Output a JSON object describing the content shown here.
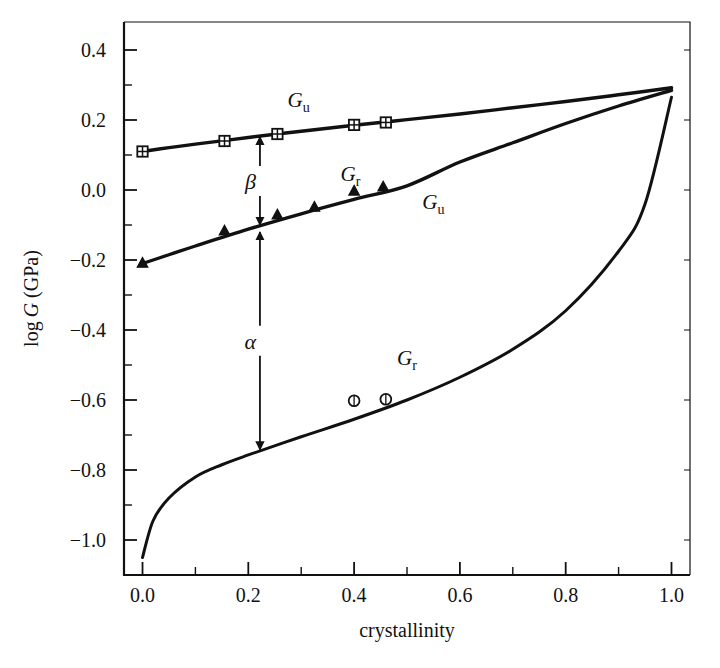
{
  "figure": {
    "background_color": "#ffffff",
    "ink_color": "#111111"
  },
  "chart_data": {
    "type": "line",
    "title": "",
    "subtitle": "",
    "xlabel": "crystallinity",
    "ylabel": "log G (GPa)",
    "xlim": [
      -0.035,
      1.035
    ],
    "ylim": [
      -1.1,
      0.48
    ],
    "grid": false,
    "legend_position": "inline-labels",
    "x_ticks_major": [
      "0.0",
      "0.2",
      "0.4",
      "0.6",
      "0.8",
      "1.0"
    ],
    "x_tick_values": [
      0.0,
      0.2,
      0.4,
      0.6,
      0.8,
      1.0
    ],
    "x_ticks_minor": [
      0.1,
      0.3,
      0.5,
      0.7,
      0.9
    ],
    "y_ticks_major": [
      "0.4",
      "0.2",
      "0.0",
      "-0.2",
      "-0.4",
      "-0.6",
      "-0.8",
      "-1.0"
    ],
    "y_tick_values": [
      0.4,
      0.2,
      0.0,
      -0.2,
      -0.4,
      -0.6,
      -0.8,
      -1.0
    ],
    "series": [
      {
        "name": "G_u upper",
        "label": "Gu",
        "label_base": "G",
        "label_sub": "u",
        "marker": "crossed-square",
        "marker_filled": true,
        "x": [
          0.0,
          0.05,
          0.1,
          0.2,
          0.3,
          0.4,
          0.5,
          0.6,
          0.7,
          0.8,
          0.9,
          1.0
        ],
        "values": [
          0.11,
          0.121,
          0.131,
          0.15,
          0.168,
          0.185,
          0.201,
          0.217,
          0.235,
          0.253,
          0.272,
          0.292
        ],
        "points_x": [
          0.0,
          0.155,
          0.255,
          0.4,
          0.46
        ],
        "points_y": [
          0.11,
          0.14,
          0.16,
          0.186,
          0.193
        ]
      },
      {
        "name": "G_r middle",
        "label": "Gr",
        "label_base": "G",
        "label_sub": "r",
        "second_label_base": "G",
        "second_label_sub": "u",
        "marker": "triangle",
        "marker_filled": true,
        "x": [
          0.0,
          0.05,
          0.1,
          0.2,
          0.3,
          0.4,
          0.5,
          0.6,
          0.7,
          0.8,
          0.9,
          1.0
        ],
        "values": [
          -0.21,
          -0.185,
          -0.16,
          -0.112,
          -0.068,
          -0.027,
          0.012,
          0.08,
          0.135,
          0.19,
          0.24,
          0.285
        ],
        "points_x": [
          0.0,
          0.155,
          0.255,
          0.325,
          0.4,
          0.455
        ],
        "points_y": [
          -0.21,
          -0.118,
          -0.072,
          -0.05,
          -0.004,
          0.008
        ]
      },
      {
        "name": "G_r lower",
        "label": "Gr",
        "label_base": "G",
        "label_sub": "r",
        "marker": "circle",
        "marker_filled": false,
        "x": [
          0.0,
          0.02,
          0.05,
          0.1,
          0.15,
          0.2,
          0.3,
          0.4,
          0.5,
          0.6,
          0.7,
          0.8,
          0.9,
          0.95,
          1.0
        ],
        "values": [
          -1.05,
          -0.945,
          -0.88,
          -0.82,
          -0.785,
          -0.757,
          -0.705,
          -0.655,
          -0.6,
          -0.535,
          -0.455,
          -0.345,
          -0.175,
          -0.04,
          0.265
        ],
        "points_x": [
          0.4,
          0.46
        ],
        "points_y": [
          -0.602,
          -0.598
        ]
      }
    ],
    "annotations": [
      {
        "name": "beta-gap",
        "text": "β",
        "x": 0.222,
        "y_top": 0.152,
        "y_bottom": -0.1,
        "style": "double-arrow-vertical"
      },
      {
        "name": "alpha-gap",
        "text": "α",
        "x": 0.222,
        "y_top": -0.12,
        "y_bottom": -0.742,
        "style": "double-arrow-vertical"
      }
    ],
    "curve_labels": [
      {
        "name": "label-gu-upper",
        "base": "G",
        "sub": "u",
        "x": 0.295,
        "y": 0.237
      },
      {
        "name": "label-gr-middle",
        "base": "G",
        "sub": "r",
        "x": 0.393,
        "y": 0.027
      },
      {
        "name": "label-gu-middle",
        "base": "G",
        "sub": "u",
        "x": 0.55,
        "y": -0.055
      },
      {
        "name": "label-gr-lower",
        "base": "G",
        "sub": "r",
        "x": 0.5,
        "y": -0.5
      }
    ]
  }
}
